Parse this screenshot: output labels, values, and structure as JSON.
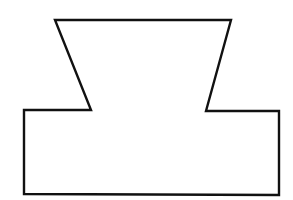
{
  "diagram": {
    "type": "outline-shape",
    "stroke_color": "#111111",
    "fill_color": "#ffffff",
    "background": "#ffffff",
    "stroke_width": 2.4,
    "points": [
      [
        55,
        20
      ],
      [
        231,
        20
      ],
      [
        206,
        111
      ],
      [
        279,
        111
      ],
      [
        279,
        195
      ],
      [
        24,
        194
      ],
      [
        24,
        110
      ],
      [
        91,
        110
      ]
    ]
  }
}
